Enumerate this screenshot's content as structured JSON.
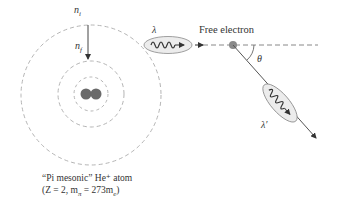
{
  "diagram": {
    "labels": {
      "n_i": "n",
      "n_i_sub": "i",
      "n_f": "n",
      "n_f_sub": "f",
      "lambda_incident": "λ",
      "lambda_scattered": "λ′",
      "free_electron": "Free electron",
      "theta": "θ"
    },
    "caption": {
      "line1": "“Pi mesonic” He⁺ atom",
      "line2": "(Z = 2, m",
      "line2_sub": "π",
      "line2_rest": " = 273m",
      "line2_sub2": "e",
      "line2_end": ")"
    },
    "colors": {
      "orbit": "#b5b5b5",
      "nucleus": "#6a6a6a",
      "electron": "#8a8a8a",
      "line": "#555555",
      "photon_fill": "#ececec"
    }
  }
}
